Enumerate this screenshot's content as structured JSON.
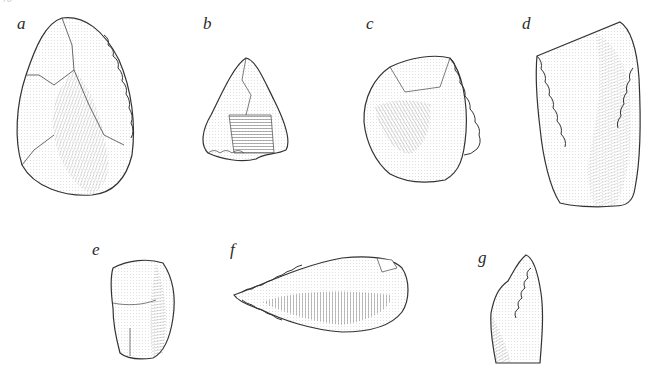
{
  "figure": {
    "page_number": "70",
    "background": "#ffffff",
    "ink_color": "#2a2a2a",
    "artifacts": [
      {
        "label": "a",
        "description": "pointed biface / retouched point, ovate"
      },
      {
        "label": "b",
        "description": "small triangular point"
      },
      {
        "label": "c",
        "description": "rounded side scraper"
      },
      {
        "label": "d",
        "description": "rectangular retouched flake / scraper"
      },
      {
        "label": "e",
        "description": "small blocky flake"
      },
      {
        "label": "f",
        "description": "elongated leaf-shaped point"
      },
      {
        "label": "g",
        "description": "denticulated blade fragment"
      }
    ]
  }
}
